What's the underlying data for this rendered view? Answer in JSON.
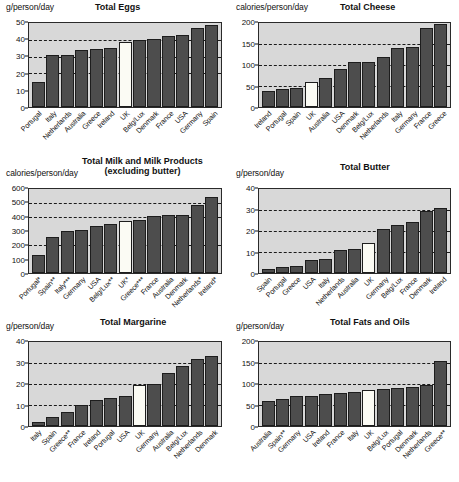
{
  "figure": {
    "panel_background": "#d8d8d8",
    "bar_color": "#4d4d4d",
    "highlight_color": "#fbfbf4",
    "highlight_country": "UK"
  },
  "chart_data": [
    {
      "type": "bar",
      "title": "Total Eggs",
      "subtitle": "",
      "ylabel": "g/person/day",
      "xlabel": "",
      "ylim": [
        0,
        50
      ],
      "yticks": [
        0,
        10,
        20,
        30,
        40,
        50
      ],
      "gridlines": [
        20,
        30,
        40
      ],
      "grid": true,
      "legend": "none",
      "highlight": "UK",
      "categories": [
        "Portugal",
        "Italy",
        "Netherlands",
        "Australia",
        "Greece",
        "Ireland",
        "UK",
        "Belg/Lux",
        "Denmark",
        "France",
        "USA",
        "Germany",
        "Spain"
      ],
      "values": [
        15,
        31,
        31,
        34,
        34.3,
        35,
        38.5,
        40,
        40.3,
        42,
        43,
        47,
        49
      ]
    },
    {
      "type": "bar",
      "title": "Total Cheese",
      "subtitle": "",
      "ylabel": "calories/person/day",
      "xlabel": "",
      "ylim": [
        0,
        200
      ],
      "yticks": [
        0,
        50,
        100,
        150,
        200
      ],
      "gridlines": [
        50,
        100,
        150
      ],
      "grid": true,
      "legend": "none",
      "highlight": "UK",
      "categories": [
        "Ireland",
        "Portugal",
        "Spain",
        "UK",
        "Australia",
        "USA",
        "Denmark",
        "Belg/Lux",
        "Netherlands",
        "Italy",
        "Germany",
        "France",
        "Greece"
      ],
      "values": [
        39,
        43,
        45,
        60,
        70,
        90,
        106,
        107,
        119,
        141,
        143,
        187,
        197
      ]
    },
    {
      "type": "bar",
      "title": "Total Milk and Milk Products",
      "subtitle": "(excluding butter)",
      "ylabel": "calories/person/day",
      "xlabel": "",
      "ylim": [
        0,
        600
      ],
      "yticks": [
        0,
        100,
        200,
        300,
        400,
        500,
        600
      ],
      "gridlines": [
        200,
        400,
        500
      ],
      "grid": true,
      "legend": "none",
      "highlight": "UK*",
      "categories": [
        "Portugal*",
        "Spain**",
        "Italy***",
        "Germany",
        "USA",
        "Belg/Lux**",
        "UK*",
        "Greece***",
        "France",
        "Australia",
        "Denmark",
        "Netherlands*",
        "Ireland*"
      ],
      "values": [
        132,
        255,
        303,
        310,
        337,
        347,
        370,
        380,
        410,
        412,
        415,
        487,
        545
      ]
    },
    {
      "type": "bar",
      "title": "Total Butter",
      "subtitle": "",
      "ylabel": "g/person/day",
      "xlabel": "",
      "ylim": [
        0,
        40
      ],
      "yticks": [
        0,
        10,
        20,
        30,
        40
      ],
      "gridlines": [
        10,
        20,
        30
      ],
      "grid": true,
      "legend": "none",
      "highlight": "UK",
      "categories": [
        "Spain",
        "Portugal",
        "Greece",
        "USA",
        "Italy",
        "Netherlands",
        "Australia",
        "UK",
        "Germany",
        "Belg/Lux",
        "France",
        "Denmark",
        "Ireland"
      ],
      "values": [
        1.7,
        2.8,
        3.4,
        6.0,
        6.8,
        10.8,
        11.4,
        14.4,
        20.8,
        23.0,
        24.2,
        29.3,
        31.0
      ]
    },
    {
      "type": "bar",
      "title": "Total Margarine",
      "subtitle": "",
      "ylabel": "g/person/day",
      "xlabel": "",
      "ylim": [
        0,
        40
      ],
      "yticks": [
        0,
        10,
        20,
        30,
        40
      ],
      "gridlines": [
        10,
        20,
        30
      ],
      "grid": true,
      "legend": "none",
      "highlight": "UK",
      "categories": [
        "Italy",
        "Spain",
        "Greece**",
        "France",
        "Ireland",
        "Portugal",
        "USA",
        "UK",
        "Germany",
        "Australia",
        "Belg/Lux",
        "Netherlands",
        "Denmark"
      ],
      "values": [
        2.0,
        4.3,
        6.7,
        9.8,
        12.4,
        13.3,
        14.1,
        19.6,
        19.8,
        25.2,
        28.5,
        31.8,
        33.4
      ]
    },
    {
      "type": "bar",
      "title": "Total Fats and Oils",
      "subtitle": "",
      "ylabel": "g/person/day",
      "xlabel": "",
      "ylim": [
        0,
        200
      ],
      "yticks": [
        0,
        50,
        100,
        150,
        200
      ],
      "gridlines": [
        50,
        100,
        150
      ],
      "grid": true,
      "legend": "none",
      "highlight": "UK",
      "categories": [
        "Australia",
        "Spain**",
        "Germany",
        "USA",
        "Ireland",
        "France",
        "Italy",
        "UK",
        "Belg/Lux",
        "Portugal",
        "Denmark",
        "Netherlands",
        "Greece**"
      ],
      "values": [
        59,
        65,
        71,
        72,
        76,
        79,
        82,
        85,
        88,
        90,
        94,
        98,
        155
      ]
    }
  ]
}
